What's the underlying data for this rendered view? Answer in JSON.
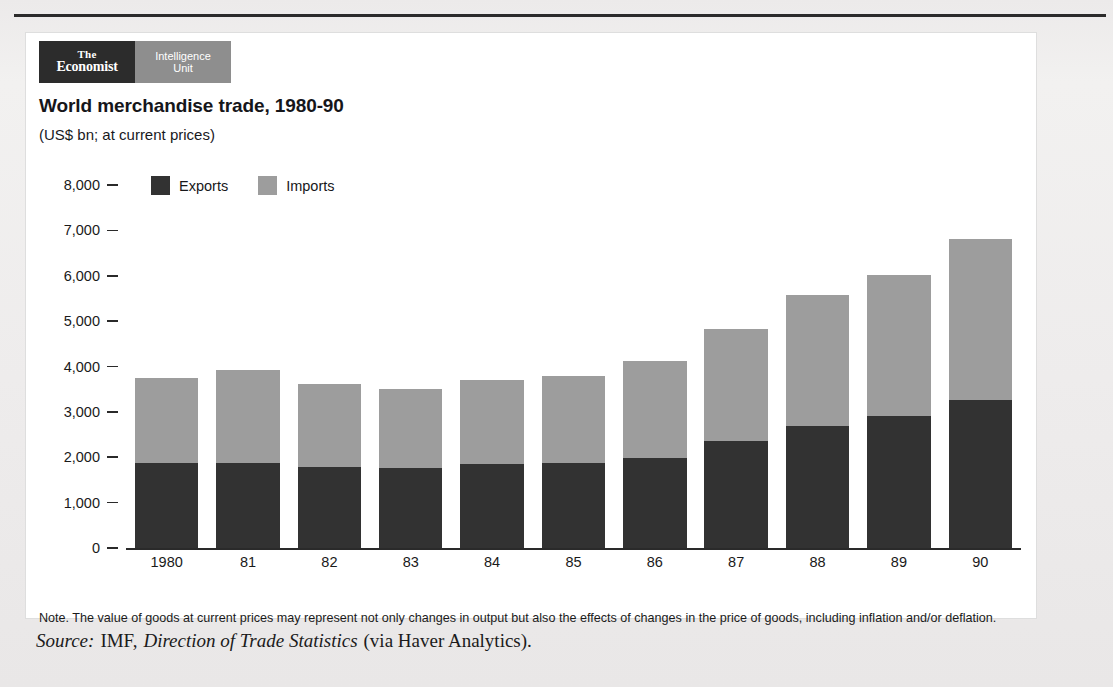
{
  "brand": {
    "economist_line1": "The",
    "economist_line2": "Economist",
    "eiu_line1": "Intelligence",
    "eiu_line2": "Unit"
  },
  "note": "Note. The value of goods at current prices may represent not only changes in output but also the effects of changes in the price of goods, including inflation and/or deflation.",
  "source": {
    "label": "Source:",
    "publisher": "IMF,",
    "publication": "Direction of Trade Statistics",
    "attribution": "(via Haver Analytics)."
  },
  "colors": {
    "exports": "#323232",
    "imports": "#9d9d9d",
    "brand_dark": "#2c2c2c",
    "brand_grey": "#8e8e8e",
    "card": "#ffffff",
    "page": "#efefef"
  },
  "chart_data": {
    "type": "bar",
    "stacked": true,
    "title": "World merchandise trade, 1980-90",
    "subtitle": "(US$ bn; at current prices)",
    "xlabel": "",
    "ylabel": "",
    "ylim": [
      0,
      8000
    ],
    "yticks": [
      0,
      1000,
      2000,
      3000,
      4000,
      5000,
      6000,
      7000,
      8000
    ],
    "ytick_labels": [
      "0",
      "1,000",
      "2,000",
      "3,000",
      "4,000",
      "5,000",
      "6,000",
      "7,000",
      "8,000"
    ],
    "grid": false,
    "legend_position": "top-left",
    "categories": [
      "1980",
      "81",
      "82",
      "83",
      "84",
      "85",
      "86",
      "87",
      "88",
      "89",
      "90"
    ],
    "series": [
      {
        "name": "Exports",
        "color": "#323232",
        "values": [
          1870,
          1880,
          1790,
          1760,
          1850,
          1880,
          1980,
          2360,
          2680,
          2900,
          3260
        ]
      },
      {
        "name": "Imports",
        "color": "#9d9d9d",
        "values": [
          1880,
          2040,
          1820,
          1740,
          1850,
          1920,
          2140,
          2470,
          2890,
          3120,
          3550
        ]
      }
    ],
    "totals": [
      3750,
      3920,
      3610,
      3500,
      3700,
      3800,
      4120,
      4830,
      5570,
      6020,
      6810
    ]
  }
}
